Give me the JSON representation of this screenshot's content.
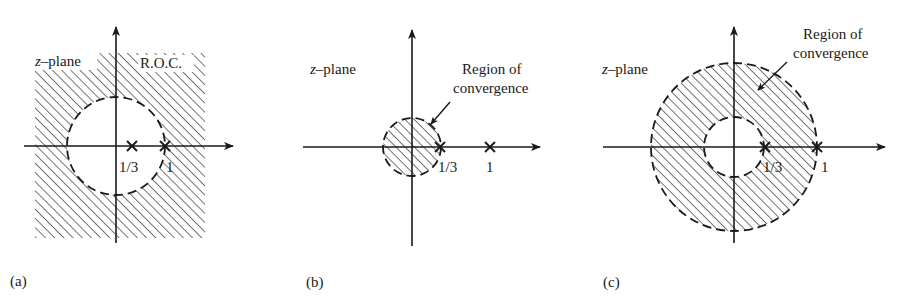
{
  "figure": {
    "panels": [
      {
        "id": "a",
        "panel_label": "(a)",
        "plane_label_z": "z",
        "plane_label_rest": "–plane",
        "roc_label": "R.O.C.",
        "roc_description": "exterior of circle |z| = 1/3 (hatched outside dashed circle)",
        "poles": [
          {
            "label": "1/3",
            "value": 0.3333
          },
          {
            "label": "1",
            "value": 1
          }
        ]
      },
      {
        "id": "b",
        "panel_label": "(b)",
        "plane_label_z": "z",
        "plane_label_rest": "–plane",
        "roc_label_line1": "Region of",
        "roc_label_line2": "convergence",
        "roc_description": "interior of circle |z| = 1/3 (hatched disc)",
        "poles": [
          {
            "label": "1/3",
            "value": 0.3333
          },
          {
            "label": "1",
            "value": 1
          }
        ]
      },
      {
        "id": "c",
        "panel_label": "(c)",
        "plane_label_z": "z",
        "plane_label_rest": "–plane",
        "roc_label_line1": "Region of",
        "roc_label_line2": "convergence",
        "roc_description": "annulus 1/3 < |z| < 1 (hatched ring)",
        "poles": [
          {
            "label": "1/3",
            "value": 0.3333
          },
          {
            "label": "1",
            "value": 1
          }
        ]
      }
    ],
    "colors": {
      "ink": "#1a1a1a",
      "background": "#ffffff",
      "hatch": "#2a2a2a"
    }
  }
}
